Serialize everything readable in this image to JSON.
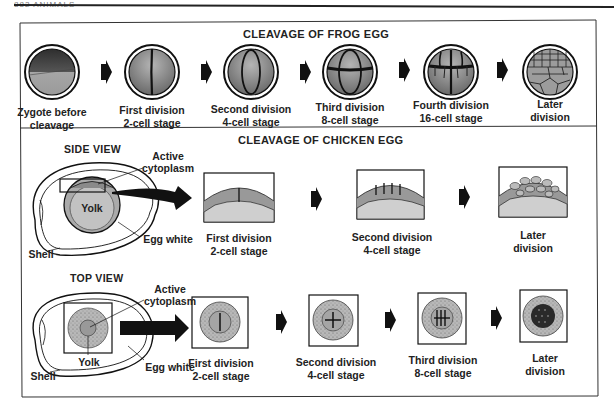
{
  "page_header": "882 ANIMALS",
  "frog": {
    "title": "CLEAVAGE OF FROG EGG",
    "stages": [
      {
        "line1": "Zygote before",
        "line2": "cleavage"
      },
      {
        "line1": "First division",
        "line2": "2-cell stage"
      },
      {
        "line1": "Second division",
        "line2": "4-cell stage"
      },
      {
        "line1": "Third division",
        "line2": "8-cell stage"
      },
      {
        "line1": "Fourth division",
        "line2": "16-cell stage"
      },
      {
        "line1": "Later",
        "line2": "division"
      }
    ]
  },
  "chicken": {
    "title": "CLEAVAGE OF CHICKEN EGG",
    "side_view": {
      "title": "SIDE VIEW",
      "labels": {
        "active_line1": "Active",
        "active_line2": "cytoplasm",
        "yolk": "Yolk",
        "egg_white": "Egg white",
        "shell": "Shell"
      },
      "stages": [
        {
          "line1": "First division",
          "line2": "2-cell stage"
        },
        {
          "line1": "Second division",
          "line2": "4-cell stage"
        },
        {
          "line1": "Later",
          "line2": "division"
        }
      ]
    },
    "top_view": {
      "title": "TOP VIEW",
      "labels": {
        "active_line1": "Active",
        "active_line2": "cytoplasm",
        "yolk": "Yolk",
        "egg_white": "Egg white",
        "shell": "Shell"
      },
      "stages": [
        {
          "line1": "First division",
          "line2": "2-cell stage"
        },
        {
          "line1": "Second division",
          "line2": "4-cell stage"
        },
        {
          "line1": "Third division",
          "line2": "8-cell stage"
        },
        {
          "line1": "Later",
          "line2": "division"
        }
      ]
    }
  },
  "colors": {
    "ink": "#1a1a1a",
    "frog_dark": "#3a3a3a",
    "frog_gray": "#9a9a9a",
    "cytoplasm": "#8f8f8f",
    "yolk_light": "#c8c8c8",
    "yolk_mid": "#a8a8a8"
  }
}
